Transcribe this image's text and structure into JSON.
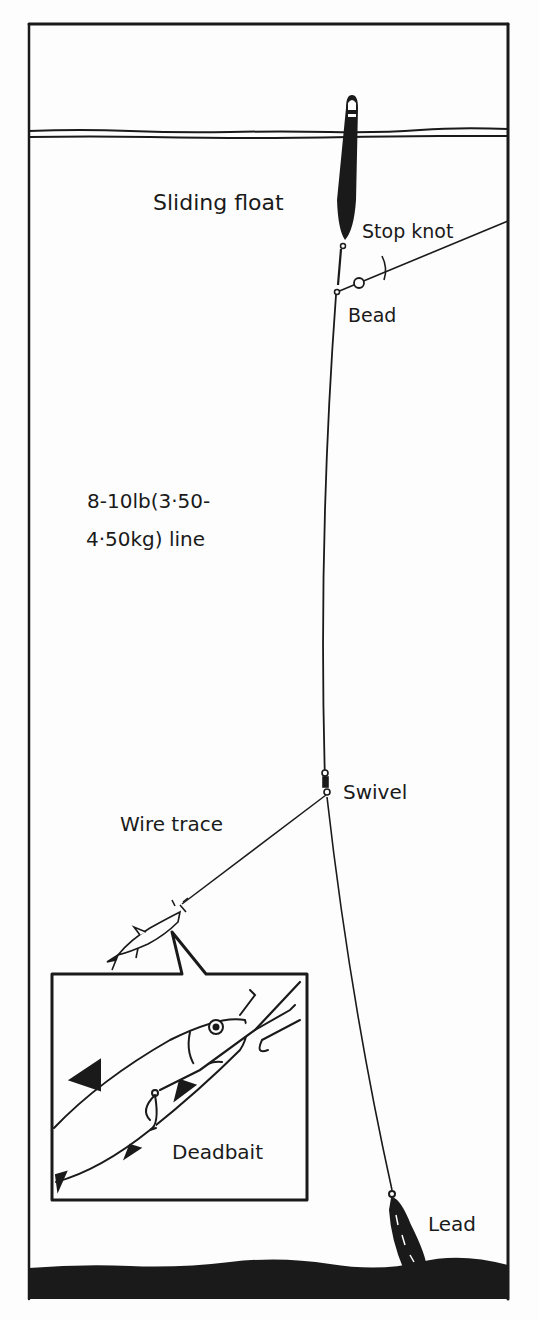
{
  "diagram": {
    "type": "fishing-rig",
    "labels": {
      "sliding_float": "Sliding float",
      "stop_knot": "Stop knot",
      "bead": "Bead",
      "line_line1": "8-10lb(3·50-",
      "line_line2": "4·50kg) line",
      "swivel": "Swivel",
      "wire_trace": "Wire trace",
      "deadbait": "Deadbait",
      "lead": "Lead"
    },
    "colors": {
      "ink": "#1a1a1a",
      "paper": "#fdfdfd"
    }
  }
}
